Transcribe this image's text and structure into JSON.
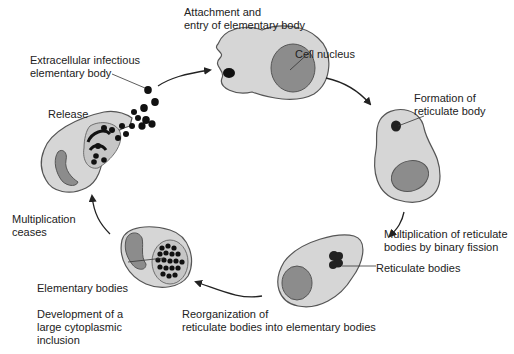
{
  "colors": {
    "cytoplasm": "#d6d6d6",
    "membrane": "#555555",
    "nucleus": "#8c8c8c",
    "body": "#111111",
    "arrow": "#222222",
    "text": "#222222"
  },
  "labels": {
    "attachment": "Attachment and\nentry of elementary body",
    "cell_nucleus": "Cell nucleus",
    "extracellular": "Extracellular infectious\nelementary body",
    "formation": "Formation of\nreticulate body",
    "release": "Release",
    "multiplication_binary": "Multiplication of reticulate\nbodies by binary fission",
    "multiplication_ceases": "Multiplication\nceases",
    "reticulate_bodies": "Reticulate bodies",
    "elementary_bodies": "Elementary bodies",
    "development": "Development of a\nlarge cytoplasmic\ninclusion",
    "reorganization": "Reorganization of\nreticulate bodies into elementary bodies"
  },
  "stages": [
    "Attachment and entry of elementary body",
    "Formation of reticulate body",
    "Multiplication of reticulate bodies by binary fission",
    "Reorganization of reticulate bodies into elementary bodies",
    "Development of a large cytoplasmic inclusion",
    "Multiplication ceases",
    "Release"
  ]
}
